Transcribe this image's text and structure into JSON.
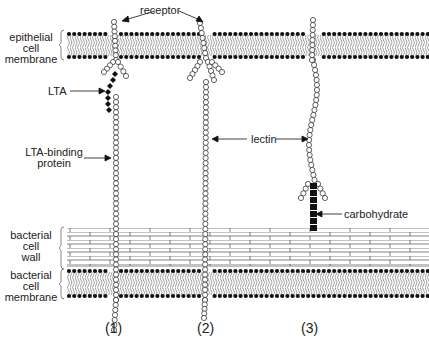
{
  "figure": {
    "labels": {
      "epithelial_membrane": [
        "epithelial",
        "cell",
        "membrane"
      ],
      "receptor": "receptor",
      "lta": "LTA",
      "lta_binding_protein": [
        "LTA-binding",
        "protein"
      ],
      "lectin": "lectin",
      "carbohydrate": "carbohydrate",
      "bacterial_wall": [
        "bacterial",
        "cell",
        "wall"
      ],
      "bacterial_membrane": [
        "bacterial",
        "cell",
        "membrane"
      ]
    },
    "panels": [
      {
        "id": "1",
        "label": "(1)",
        "mechanism": "LTA / LTA-binding protein"
      },
      {
        "id": "2",
        "label": "(2)",
        "mechanism": "lectin"
      },
      {
        "id": "3",
        "label": "(3)",
        "mechanism": "lectin binding carbohydrate"
      }
    ],
    "colors": {
      "ink": "#111111",
      "bead_fill": "#ffffff",
      "lipid_tail": "#888888",
      "background": "#ffffff"
    }
  }
}
